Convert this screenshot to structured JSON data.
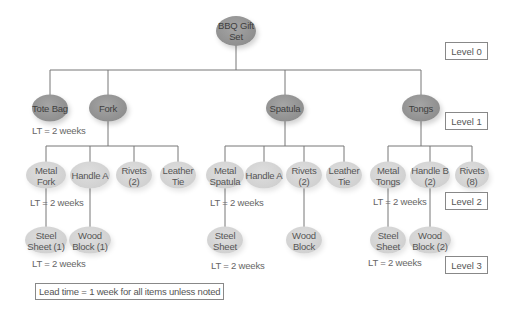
{
  "diagram": {
    "levels": [
      "Level 0",
      "Level 1",
      "Level 2",
      "Level 3"
    ],
    "note": "Lead time = 1 week for all items unless noted",
    "root": {
      "label": "BBQ Gift Set"
    },
    "level1": [
      {
        "label": "Tote Bag",
        "lead_time": "LT = 2 weeks"
      },
      {
        "label": "Fork"
      },
      {
        "label": "Spatula"
      },
      {
        "label": "Tongs"
      }
    ],
    "level2": {
      "fork": [
        {
          "label": "Metal Fork",
          "lead_time": "LT = 2 weeks"
        },
        {
          "label": "Handle A"
        },
        {
          "label": "Rivets (2)"
        },
        {
          "label": "Leather Tie"
        }
      ],
      "spatula": [
        {
          "label": "Metal Spatula",
          "lead_time": "LT = 2 weeks"
        },
        {
          "label": "Handle A"
        },
        {
          "label": "Rivets (2)"
        },
        {
          "label": "Leather Tie"
        }
      ],
      "tongs": [
        {
          "label": "Metal Tongs",
          "lead_time": "LT = 2 weeks"
        },
        {
          "label": "Handle B (2)"
        },
        {
          "label": "Rivets (8)"
        }
      ]
    },
    "level3": {
      "fork": [
        {
          "label": "Steel Sheet (1)",
          "lead_time": "LT = 2 weeks"
        },
        {
          "label": "Wood Block (1)"
        }
      ],
      "spatula": [
        {
          "label": "Steel Sheet",
          "lead_time": "LT = 2 weeks"
        },
        {
          "label": "Wood Block"
        }
      ],
      "tongs": [
        {
          "label": "Steel Sheet",
          "lead_time": "LT = 2 weeks"
        },
        {
          "label": "Wood Block (2)"
        }
      ]
    },
    "colors": {
      "upper_node": "#929292",
      "lower_node": "#d2d2d2",
      "line": "#777777"
    }
  }
}
